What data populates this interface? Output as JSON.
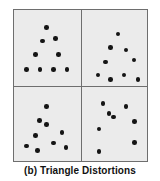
{
  "figure": {
    "caption": "(b) Triangle Distortions",
    "panel_background": "#ebebeb",
    "border_color": "#6e6e6e",
    "dot_color": "#151515",
    "page_background": "#ffffff"
  },
  "chart_data": {
    "type": "scatter",
    "title": "(b) Triangle Distortions",
    "xlabel": "",
    "ylabel": "",
    "grid": false,
    "legend": null,
    "layout": {
      "rows": 2,
      "cols": 2,
      "panel_count": 4,
      "xlim": [
        0,
        100
      ],
      "ylim": [
        0,
        100
      ]
    },
    "panels": [
      {
        "name": "prototype-triangle-top-left",
        "position": "top-left",
        "point_count": 9,
        "points": [
          {
            "x": 49,
            "y": 23
          },
          {
            "x": 43,
            "y": 41
          },
          {
            "x": 62,
            "y": 38
          },
          {
            "x": 32,
            "y": 59
          },
          {
            "x": 67,
            "y": 59
          },
          {
            "x": 19,
            "y": 79
          },
          {
            "x": 39,
            "y": 79
          },
          {
            "x": 59,
            "y": 79
          },
          {
            "x": 80,
            "y": 79
          }
        ]
      },
      {
        "name": "distorted-triangle-top-right",
        "position": "top-right",
        "point_count": 9,
        "points": [
          {
            "x": 56,
            "y": 32
          },
          {
            "x": 44,
            "y": 50
          },
          {
            "x": 68,
            "y": 53
          },
          {
            "x": 37,
            "y": 69
          },
          {
            "x": 80,
            "y": 66
          },
          {
            "x": 25,
            "y": 86
          },
          {
            "x": 44,
            "y": 92
          },
          {
            "x": 65,
            "y": 86
          },
          {
            "x": 86,
            "y": 92
          }
        ]
      },
      {
        "name": "distorted-triangle-bottom-left",
        "position": "bottom-left",
        "point_count": 9,
        "points": [
          {
            "x": 49,
            "y": 27
          },
          {
            "x": 38,
            "y": 46
          },
          {
            "x": 49,
            "y": 51
          },
          {
            "x": 32,
            "y": 66
          },
          {
            "x": 72,
            "y": 62
          },
          {
            "x": 19,
            "y": 80
          },
          {
            "x": 35,
            "y": 86
          },
          {
            "x": 59,
            "y": 76
          },
          {
            "x": 78,
            "y": 82
          }
        ]
      },
      {
        "name": "distorted-triangle-bottom-right",
        "position": "bottom-right",
        "point_count": 8,
        "points": [
          {
            "x": 33,
            "y": 23
          },
          {
            "x": 68,
            "y": 27
          },
          {
            "x": 42,
            "y": 36
          },
          {
            "x": 49,
            "y": 41
          },
          {
            "x": 81,
            "y": 47
          },
          {
            "x": 27,
            "y": 57
          },
          {
            "x": 81,
            "y": 75
          },
          {
            "x": 27,
            "y": 87
          }
        ]
      }
    ]
  }
}
